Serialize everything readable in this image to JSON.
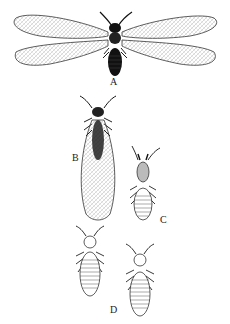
{
  "figure": {
    "labels": {
      "a": "A",
      "b": "B",
      "c": "C",
      "d": "D"
    },
    "specimens": [
      {
        "label": "A",
        "description": "winged adult, wings spread"
      },
      {
        "label": "B",
        "description": "winged adult, wings folded"
      },
      {
        "label": "C",
        "description": "soldier"
      },
      {
        "label": "D",
        "description": "workers (two)"
      }
    ]
  }
}
